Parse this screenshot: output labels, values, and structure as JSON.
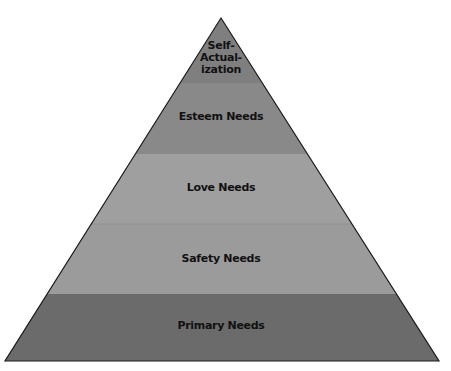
{
  "diagram": {
    "type": "pyramid",
    "levels": [
      {
        "label": "Self-\nActual-\nization",
        "lines": [
          "Self-",
          "Actual-",
          "ization"
        ],
        "color": "#7e7e7e"
      },
      {
        "label": "Esteem Needs",
        "color": "#888888"
      },
      {
        "label": "Love Needs",
        "color": "#9e9e9e"
      },
      {
        "label": "Safety Needs",
        "color": "#9a9a9a"
      },
      {
        "label": "Primary Needs",
        "color": "#6a6a6a"
      }
    ]
  }
}
